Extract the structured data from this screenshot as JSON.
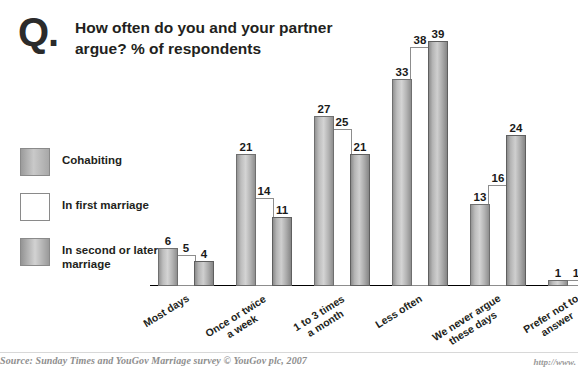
{
  "header": {
    "q_mark": "Q.",
    "title": "How often do you and your partner argue? % of respondents"
  },
  "legend": {
    "position": "left",
    "items": [
      {
        "label": "Cohabiting",
        "swatch": "cohabiting-swatch",
        "color": "#bdbdbd"
      },
      {
        "label": "In first marriage",
        "swatch": "first-marriage-swatch",
        "color": "#ffffff"
      },
      {
        "label": "In second or later marriage",
        "swatch": "second-marriage-swatch",
        "color": "#b0b0b0"
      }
    ]
  },
  "footer": {
    "source": "Source: Sunday Times and YouGov Marriage survey © YouGov plc, 2007",
    "url": "http://www."
  },
  "chart_data": {
    "type": "bar",
    "title": "How often do you and your partner argue? % of respondents",
    "xlabel": "",
    "ylabel": "% of respondents",
    "ylim": [
      0,
      42
    ],
    "grid": false,
    "legend_position": "left",
    "categories": [
      "Most days",
      "Once or twice a week",
      "1 to 3 times a month",
      "Less often",
      "We never argue these days",
      "Prefer not to answer"
    ],
    "category_lines": [
      [
        "Most days"
      ],
      [
        "Once or twice",
        "a week"
      ],
      [
        "1 to 3 times",
        "a month"
      ],
      [
        "Less often"
      ],
      [
        "We never argue",
        "these days"
      ],
      [
        "Prefer not to",
        "answer"
      ]
    ],
    "series": [
      {
        "name": "Cohabiting",
        "values": [
          6,
          21,
          27,
          33,
          13,
          1
        ]
      },
      {
        "name": "In first marriage",
        "values": [
          5,
          14,
          25,
          38,
          16,
          1
        ]
      },
      {
        "name": "In second or later marriage",
        "values": [
          4,
          11,
          21,
          39,
          24,
          1
        ]
      }
    ]
  }
}
